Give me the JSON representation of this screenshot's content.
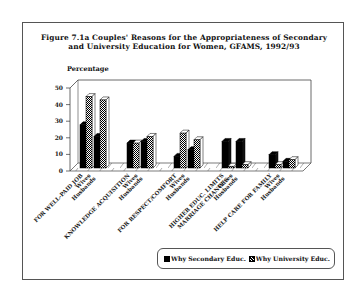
{
  "figure": {
    "title_line1": "Figure 7.1a  Couples' Reasons for the Appropriateness of Secondary",
    "title_line2": "and University Education for Women, GFAMS, 1992/93",
    "y_axis_label": "Percentage"
  },
  "legend": {
    "items": [
      {
        "label": "Why Secondary Educ.",
        "pattern": "solid-black"
      },
      {
        "label": "Why University Educ.",
        "pattern": "checkered"
      }
    ]
  },
  "chart_data": {
    "type": "bar",
    "style": "3d-grouped",
    "title": "Figure 7.1a Couples' Reasons for the Appropriateness of Secondary and University Education for Women, GFAMS, 1992/93",
    "ylabel": "Percentage",
    "xlabel": "",
    "ylim": [
      0,
      50
    ],
    "yticks": [
      0,
      10,
      20,
      30,
      40,
      50
    ],
    "grid": false,
    "legend_position": "bottom-right",
    "categories": [
      {
        "reason": "FOR WELL-PAID JOB",
        "subgroups": [
          "Wives",
          "Husbands"
        ]
      },
      {
        "reason": "KNOWLEDGE ACQUISITION",
        "subgroups": [
          "Wives",
          "Husbands"
        ]
      },
      {
        "reason": "FOR RESPECT/COMFORT",
        "subgroups": [
          "Wives",
          "Husbands"
        ]
      },
      {
        "reason": "HIGHER EDUC. LIMITS MARRIAGE CHANCES",
        "subgroups": [
          "Wives",
          "Husbands"
        ]
      },
      {
        "reason": "HELP CARE FOR FAMILY",
        "subgroups": [
          "Wives",
          "Husbands"
        ]
      }
    ],
    "x_labels": [
      "FOR WELL-PAID JOB",
      "Wives",
      "Husbands",
      "KNOWLEDGE ACQUISITION",
      "Wives",
      "Husbands",
      "FOR RESPECT/COMFORT",
      "Wives",
      "Husbands",
      "HIGHER EDUC. LIMITS MARRIAGE CHANCES",
      "Wives",
      "Husbands",
      "HELP CARE FOR FAMILY",
      "Wives",
      "Husbands"
    ],
    "series": [
      {
        "name": "Why Secondary Educ.",
        "values": {
          "Wives": [
            26,
            15,
            7,
            16,
            8
          ],
          "Husbands": [
            19,
            16,
            11,
            16,
            4
          ]
        }
      },
      {
        "name": "Why University Educ.",
        "values": {
          "Wives": [
            43,
            15,
            21,
            1,
            2
          ],
          "Husbands": [
            41,
            19,
            17,
            2,
            5
          ]
        }
      }
    ]
  }
}
